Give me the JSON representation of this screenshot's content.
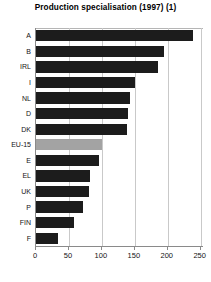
{
  "chart_data": {
    "type": "bar",
    "orientation": "horizontal",
    "title": "Production specialisation (1997) (1)",
    "xlabel": "",
    "ylabel": "",
    "categories": [
      "A",
      "B",
      "IRL",
      "I",
      "NL",
      "D",
      "DK",
      "EU-15",
      "E",
      "EL",
      "UK",
      "P",
      "FIN",
      "F"
    ],
    "values": [
      238,
      195,
      185,
      150,
      143,
      140,
      138,
      100,
      95,
      82,
      80,
      72,
      57,
      33
    ],
    "xlim": [
      0,
      255
    ],
    "ylim": null,
    "xticks": [
      0,
      50,
      100,
      150,
      200,
      250
    ],
    "xticklabels": [
      "0",
      "50",
      "100",
      "150",
      "200",
      "250"
    ],
    "grid": "vertical",
    "legend": null,
    "highlight_category": "EU-15",
    "colors": {
      "bar": "#1c1c1c",
      "bar_highlight": "#a3a3a3",
      "gridline": "#c9c9c9",
      "axis": "#8a8a8a",
      "text": "#141414",
      "background": "#ffffff"
    }
  }
}
